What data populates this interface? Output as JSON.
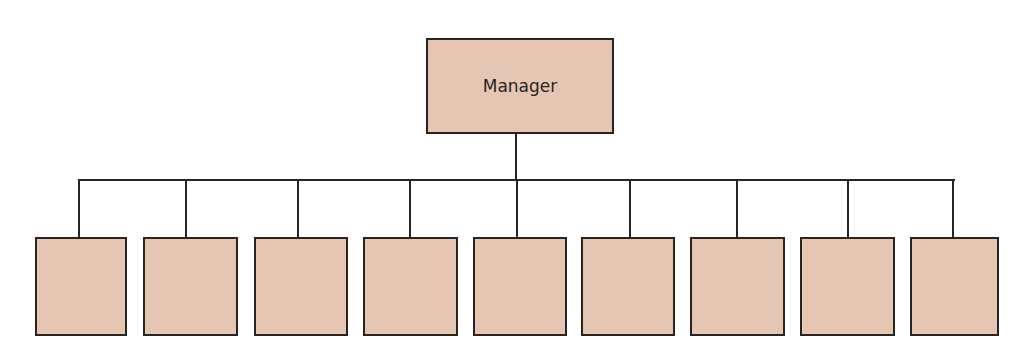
{
  "diagram": {
    "type": "org-chart",
    "root": {
      "label": "Manager"
    },
    "children_count": 9,
    "children": [
      {
        "label": "",
        "x": 35,
        "w": 92,
        "cx": 79
      },
      {
        "label": "",
        "x": 143,
        "w": 95,
        "cx": 186
      },
      {
        "label": "",
        "x": 254,
        "w": 94,
        "cx": 298
      },
      {
        "label": "",
        "x": 363,
        "w": 95,
        "cx": 410
      },
      {
        "label": "",
        "x": 473,
        "w": 94,
        "cx": 517
      },
      {
        "label": "",
        "x": 581,
        "w": 94,
        "cx": 630
      },
      {
        "label": "",
        "x": 690,
        "w": 95,
        "cx": 737
      },
      {
        "label": "",
        "x": 800,
        "w": 95,
        "cx": 848
      },
      {
        "label": "",
        "x": 910,
        "w": 89,
        "cx": 953
      }
    ],
    "colors": {
      "box_fill": "#e5c6b3",
      "stroke": "#2a2320"
    }
  }
}
